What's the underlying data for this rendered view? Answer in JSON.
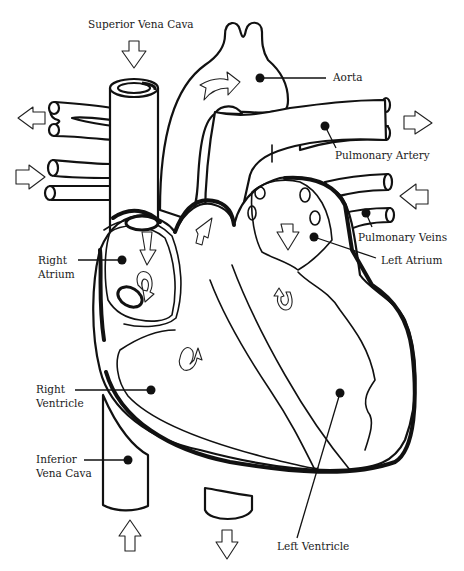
{
  "diagram": {
    "labels": {
      "superior_vena_cava": "Superior Vena Cava",
      "aorta": "Aorta",
      "pulmonary_artery": "Pulmonary Artery",
      "pulmonary_veins": "Pulmonary Veins",
      "left_atrium": "Left Atrium",
      "right_atrium_line1": "Right",
      "right_atrium_line2": "Atrium",
      "right_ventricle_line1": "Right",
      "right_ventricle_line2": "Ventricle",
      "inferior_vena_cava_line1": "Inferior",
      "inferior_vena_cava_line2": "Vena Cava",
      "left_ventricle": "Left Ventricle"
    },
    "flow_arrows": [
      {
        "name": "superior-vena-cava-inflow",
        "direction": "down"
      },
      {
        "name": "aorta-outflow",
        "direction": "right"
      },
      {
        "name": "right-pulmonary-artery-out",
        "direction": "left"
      },
      {
        "name": "left-pulmonary-artery-out",
        "direction": "right"
      },
      {
        "name": "right-pulmonary-veins-in",
        "direction": "right"
      },
      {
        "name": "left-pulmonary-veins-in",
        "direction": "left"
      },
      {
        "name": "inferior-vena-cava-inflow",
        "direction": "up"
      },
      {
        "name": "descending-aorta-outflow",
        "direction": "down"
      }
    ],
    "colors": {
      "line": "#111111",
      "fill": "#ffffff"
    }
  }
}
